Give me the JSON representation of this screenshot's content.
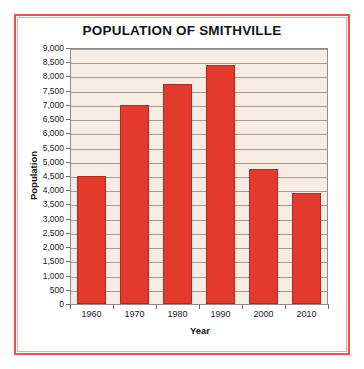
{
  "chart_data": {
    "type": "bar",
    "title": "POPULATION OF SMITHVILLE",
    "xlabel": "Year",
    "ylabel": "Population",
    "categories": [
      "1960",
      "1970",
      "1980",
      "1990",
      "2000",
      "2010"
    ],
    "values": [
      4500,
      7000,
      7750,
      8400,
      4750,
      3900
    ],
    "ylim": [
      0,
      9000
    ],
    "ytick_values": [
      0,
      500,
      1000,
      1500,
      2000,
      2500,
      3000,
      3500,
      4000,
      4500,
      5000,
      5500,
      6000,
      6500,
      7000,
      7500,
      8000,
      8500,
      9000
    ],
    "ytick_labels": [
      "0",
      "500",
      "1,000",
      "1,500",
      "2,000",
      "2,500",
      "3,000",
      "3,500",
      "4,000",
      "4,500",
      "5,000",
      "5,500",
      "6,000",
      "6,500",
      "7,000",
      "7,500",
      "8,000",
      "8,500",
      "9,000"
    ],
    "grid": true,
    "legend": false,
    "bar_color": "#e23b2e",
    "bar_edge_color": "#b02a20",
    "plot_background": "#f7ece3",
    "gridline_color": "#a09a94",
    "frame_color": "#e2574c",
    "frame_inner_color": "#f0a9a2"
  }
}
